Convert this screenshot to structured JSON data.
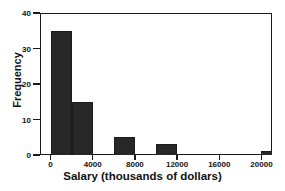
{
  "chart_data": {
    "type": "bar",
    "title": "",
    "subtitle": "",
    "xlabel": "Salary (thousands of dollars)",
    "ylabel": "Frequency",
    "bin_width": 2000,
    "bin_starts": [
      0,
      2000,
      4000,
      6000,
      8000,
      10000,
      12000,
      14000,
      16000,
      18000,
      20000
    ],
    "categories": [
      "0-2000",
      "2000-4000",
      "4000-6000",
      "6000-8000",
      "8000-10000",
      "10000-12000",
      "12000-14000",
      "14000-16000",
      "16000-18000",
      "18000-20000",
      "20000-22000"
    ],
    "values": [
      35,
      15,
      0,
      5,
      0,
      3,
      0,
      0,
      0,
      0,
      1
    ],
    "xlim": [
      -1000,
      21000
    ],
    "ylim": [
      0,
      40
    ],
    "xticks": [
      0,
      4000,
      8000,
      12000,
      16000,
      20000
    ],
    "xtick_labels": [
      "0",
      "4000",
      "8000",
      "12000",
      "16000",
      "20000"
    ],
    "yticks": [
      0,
      10,
      20,
      30,
      40
    ],
    "ytick_labels": [
      "0",
      "10",
      "20",
      "30",
      "40"
    ],
    "grid": false,
    "legend": false,
    "legend_position": "none",
    "bar_color": "#272727",
    "axis_color": "#1a1a1a",
    "background_color": "#ffffff",
    "bars": [
      {
        "label": "0-2000",
        "start": 0,
        "end": 2000,
        "value": 35
      },
      {
        "label": "2000-4000",
        "start": 2000,
        "end": 4000,
        "value": 15
      },
      {
        "label": "6000-8000",
        "start": 6000,
        "end": 8000,
        "value": 5
      },
      {
        "label": "10000-12000",
        "start": 10000,
        "end": 12000,
        "value": 3
      },
      {
        "label": "20000-22000",
        "start": 20000,
        "end": 22000,
        "value": 1
      }
    ]
  }
}
